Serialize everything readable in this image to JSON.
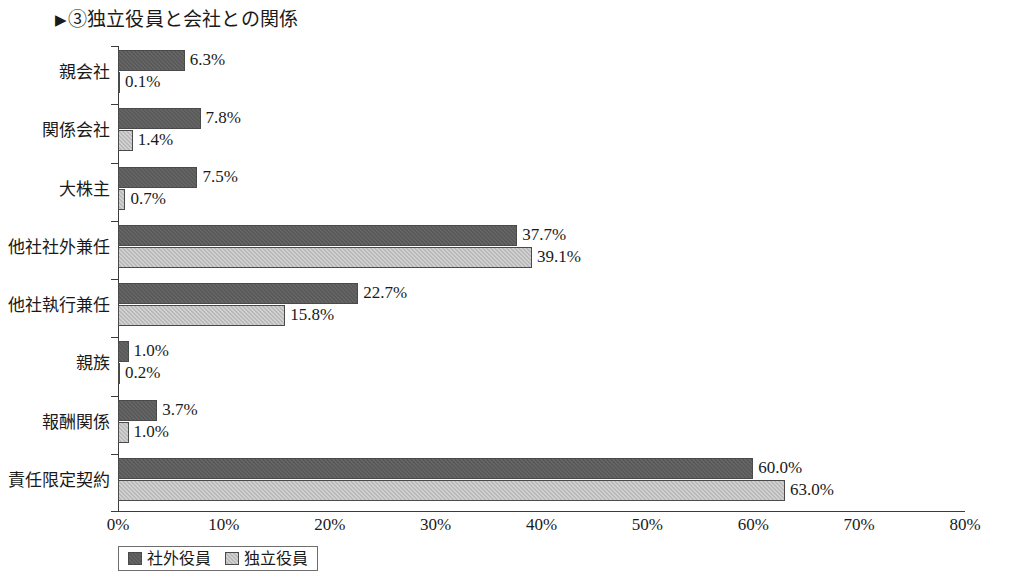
{
  "title": {
    "marker": "▶",
    "text": "③独立役員と会社との関係"
  },
  "legend": {
    "items": [
      {
        "label": "社外役員",
        "color": "#595959"
      },
      {
        "label": "独立役員",
        "color": "#b9b9b9"
      }
    ]
  },
  "chart_data": {
    "type": "bar",
    "orientation": "horizontal",
    "title": "③独立役員と会社との関係",
    "xlabel": "",
    "ylabel": "",
    "xlim": [
      0,
      80
    ],
    "xticks": [
      0,
      10,
      20,
      30,
      40,
      50,
      60,
      70,
      80
    ],
    "xtick_labels": [
      "0%",
      "10%",
      "20%",
      "30%",
      "40%",
      "50%",
      "60%",
      "70%",
      "80%"
    ],
    "grid": false,
    "legend_position": "bottom-left",
    "categories": [
      "親会社",
      "関係会社",
      "大株主",
      "他社社外兼任",
      "他社執行兼任",
      "親族",
      "報酬関係",
      "責任限定契約"
    ],
    "series": [
      {
        "name": "社外役員",
        "color": "#595959",
        "values": [
          6.3,
          7.8,
          7.5,
          37.7,
          22.7,
          1.0,
          3.7,
          60.0
        ],
        "labels": [
          "6.3%",
          "7.8%",
          "7.5%",
          "37.7%",
          "22.7%",
          "1.0%",
          "3.7%",
          "60.0%"
        ]
      },
      {
        "name": "独立役員",
        "color": "#b9b9b9",
        "values": [
          0.1,
          1.4,
          0.7,
          39.1,
          15.8,
          0.2,
          1.0,
          63.0
        ],
        "labels": [
          "0.1%",
          "1.4%",
          "0.7%",
          "39.1%",
          "15.8%",
          "0.2%",
          "1.0%",
          "63.0%"
        ]
      }
    ]
  }
}
